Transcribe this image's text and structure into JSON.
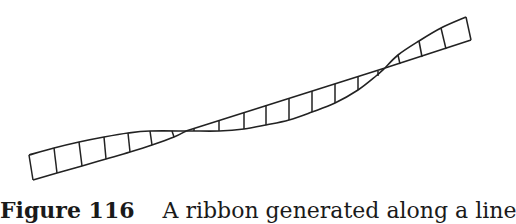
{
  "figure": {
    "caption": {
      "label": "Figure 116",
      "text": "A ribbon generated along a line"
    },
    "stroke_color": "#222222",
    "background": "#ffffff",
    "ribbon": {
      "description": "Twisting ribbon drawn as ladder segments along a rising line, with two cross-over twist points",
      "twist_points": [
        [
          186,
          131
        ],
        [
          385,
          68
        ]
      ],
      "segments": [
        {
          "name": "left",
          "top_edge": [
            [
              29,
              155
            ],
            [
              54,
              148
            ],
            [
              79,
              142
            ],
            [
              104,
              137
            ],
            [
              128,
              133
            ],
            [
              150,
              131
            ],
            [
              186,
              131
            ]
          ],
          "bottom_edge": [
            [
              33,
              180
            ],
            [
              57,
              173
            ],
            [
              82,
              166
            ],
            [
              106,
              159
            ],
            [
              130,
              152
            ],
            [
              152,
              145
            ],
            [
              174,
              137
            ],
            [
              186,
              131
            ]
          ],
          "rungs": [
            [
              [
                29,
                155
              ],
              [
                33,
                180
              ]
            ],
            [
              [
                54,
                148
              ],
              [
                57,
                173
              ]
            ],
            [
              [
                79,
                142
              ],
              [
                82,
                166
              ]
            ],
            [
              [
                104,
                137
              ],
              [
                106,
                159
              ]
            ],
            [
              [
                128,
                133
              ],
              [
                130,
                152
              ]
            ],
            [
              [
                150,
                131
              ],
              [
                152,
                145
              ]
            ],
            [
              [
                172,
                131
              ],
              [
                174,
                137
              ]
            ]
          ]
        },
        {
          "name": "middle",
          "top_edge": [
            [
              186,
              131
            ],
            [
              385,
              68
            ]
          ],
          "bottom_edge": [
            [
              186,
              131
            ],
            [
              194,
              131
            ],
            [
              219,
              131
            ],
            [
              244,
              129
            ],
            [
              266,
              125
            ],
            [
              289,
              120
            ],
            [
              312,
              112
            ],
            [
              335,
              103
            ],
            [
              358,
              90
            ],
            [
              376,
              76
            ],
            [
              385,
              68
            ]
          ],
          "rungs": [
            [
              [
                194,
                128
              ],
              [
                194,
                131
              ]
            ],
            [
              [
                219,
                120
              ],
              [
                219,
                131
              ]
            ],
            [
              [
                244,
                112
              ],
              [
                244,
                129
              ]
            ],
            [
              [
                266,
                105
              ],
              [
                266,
                125
              ]
            ],
            [
              [
                289,
                98
              ],
              [
                289,
                120
              ]
            ],
            [
              [
                312,
                91
              ],
              [
                312,
                112
              ]
            ],
            [
              [
                335,
                84
              ],
              [
                335,
                103
              ]
            ],
            [
              [
                358,
                77
              ],
              [
                358,
                90
              ]
            ],
            [
              [
                378,
                71
              ],
              [
                378,
                76
              ]
            ]
          ]
        },
        {
          "name": "right",
          "top_edge": [
            [
              385,
              68
            ],
            [
              398,
              55
            ],
            [
              419,
              41
            ],
            [
              441,
              28
            ],
            [
              466,
              17
            ]
          ],
          "bottom_edge": [
            [
              385,
              68
            ],
            [
              471,
              40
            ]
          ],
          "rungs": [
            [
              [
                398,
                55
              ],
              [
                400,
                64
              ]
            ],
            [
              [
                419,
                41
              ],
              [
                422,
                57
              ]
            ],
            [
              [
                441,
                28
              ],
              [
                446,
                49
              ]
            ],
            [
              [
                466,
                17
              ],
              [
                471,
                40
              ]
            ]
          ]
        }
      ]
    }
  }
}
